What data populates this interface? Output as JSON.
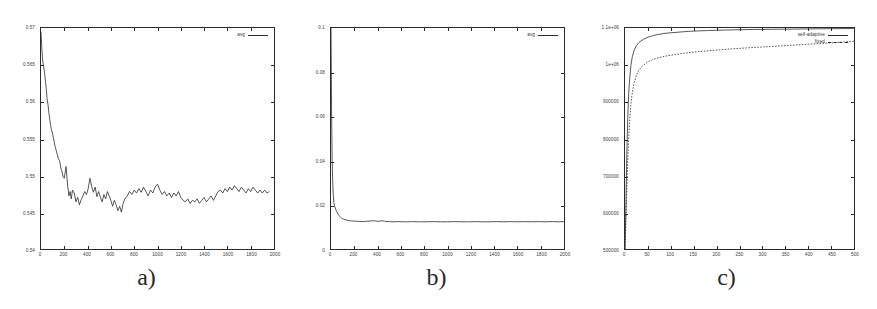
{
  "figure": {
    "background": "#ffffff",
    "line_color": "#2b2b2b",
    "panel_count": 3
  },
  "panels": [
    {
      "id": "a",
      "caption": "a)",
      "legend": [
        {
          "label": "avg",
          "style": "solid"
        }
      ],
      "chart_data": {
        "type": "line",
        "title": "",
        "xlabel": "",
        "ylabel": "",
        "xlim": [
          0,
          2000
        ],
        "ylim": [
          0.54,
          0.57
        ],
        "grid": false,
        "legend_position": "top-right",
        "xticks": [
          0,
          200,
          400,
          600,
          800,
          1000,
          1200,
          1400,
          1600,
          1800,
          2000
        ],
        "xtick_labels": [
          "0",
          "200",
          "400",
          "600",
          "800",
          "1000",
          "1200",
          "1400",
          "1600",
          "1800",
          "2000"
        ],
        "yticks": [
          0.54,
          0.545,
          0.55,
          0.555,
          0.56,
          0.565,
          0.57
        ],
        "ytick_labels": [
          "0.54",
          "0.545",
          "0.55",
          "0.555",
          "0.56",
          "0.565",
          "0.57"
        ],
        "series": [
          {
            "name": "avg",
            "x": [
              0,
              8,
              15,
              22,
              30,
              38,
              45,
              52,
              60,
              70,
              80,
              90,
              100,
              110,
              120,
              130,
              140,
              150,
              160,
              170,
              180,
              190,
              200,
              215,
              230,
              240,
              250,
              260,
              270,
              285,
              300,
              315,
              330,
              345,
              360,
              375,
              390,
              405,
              420,
              435,
              450,
              465,
              480,
              495,
              510,
              525,
              540,
              555,
              570,
              585,
              600,
              615,
              630,
              645,
              660,
              675,
              690,
              705,
              720,
              740,
              760,
              780,
              800,
              820,
              840,
              860,
              880,
              900,
              920,
              940,
              960,
              980,
              1000,
              1020,
              1040,
              1060,
              1080,
              1100,
              1120,
              1140,
              1160,
              1180,
              1200,
              1220,
              1240,
              1260,
              1280,
              1300,
              1320,
              1340,
              1360,
              1380,
              1400,
              1420,
              1440,
              1460,
              1480,
              1500,
              1520,
              1540,
              1560,
              1580,
              1600,
              1620,
              1640,
              1660,
              1680,
              1700,
              1720,
              1740,
              1760,
              1780,
              1800,
              1820,
              1840,
              1860,
              1880,
              1900,
              1920,
              1940,
              1960,
              1980,
              2000
            ],
            "y": [
              0.5695,
              0.567,
              0.5655,
              0.5648,
              0.564,
              0.5628,
              0.5618,
              0.5604,
              0.5596,
              0.5582,
              0.557,
              0.5562,
              0.5556,
              0.5548,
              0.554,
              0.5534,
              0.5528,
              0.5522,
              0.552,
              0.551,
              0.5505,
              0.5498,
              0.5496,
              0.5512,
              0.5484,
              0.5472,
              0.5478,
              0.5468,
              0.548,
              0.5476,
              0.5464,
              0.547,
              0.546,
              0.5467,
              0.5472,
              0.5478,
              0.5474,
              0.5482,
              0.5496,
              0.5485,
              0.5477,
              0.5484,
              0.5471,
              0.5478,
              0.547,
              0.5464,
              0.5474,
              0.5468,
              0.5478,
              0.5472,
              0.5466,
              0.5458,
              0.5466,
              0.546,
              0.5452,
              0.5458,
              0.545,
              0.5462,
              0.5468,
              0.5472,
              0.5478,
              0.5474,
              0.548,
              0.5476,
              0.5482,
              0.5477,
              0.5484,
              0.5478,
              0.5472,
              0.548,
              0.5476,
              0.5484,
              0.5488,
              0.548,
              0.5474,
              0.5478,
              0.5472,
              0.5476,
              0.547,
              0.5476,
              0.5472,
              0.5478,
              0.547,
              0.5466,
              0.5464,
              0.5468,
              0.5462,
              0.5466,
              0.5464,
              0.5468,
              0.5462,
              0.5466,
              0.547,
              0.5464,
              0.5468,
              0.5472,
              0.5466,
              0.5472,
              0.5478,
              0.548,
              0.5476,
              0.5482,
              0.5478,
              0.5484,
              0.548,
              0.5486,
              0.5482,
              0.5478,
              0.5484,
              0.548,
              0.5476,
              0.5482,
              0.5478,
              0.5484,
              0.548,
              0.5476,
              0.548,
              0.5476,
              0.548,
              0.5476,
              0.5478
            ]
          }
        ]
      }
    },
    {
      "id": "b",
      "caption": "b)",
      "legend": [
        {
          "label": "avg",
          "style": "solid"
        }
      ],
      "chart_data": {
        "type": "line",
        "title": "",
        "xlabel": "",
        "ylabel": "",
        "xlim": [
          0,
          2000
        ],
        "ylim": [
          0,
          0.1
        ],
        "grid": false,
        "legend_position": "top-right",
        "xticks": [
          0,
          200,
          400,
          600,
          800,
          1000,
          1200,
          1400,
          1600,
          1800,
          2000
        ],
        "xtick_labels": [
          "0",
          "200",
          "400",
          "600",
          "800",
          "1000",
          "1200",
          "1400",
          "1600",
          "1800",
          "2000"
        ],
        "yticks": [
          0,
          0.02,
          0.04,
          0.06,
          0.08,
          0.1
        ],
        "ytick_labels": [
          "0",
          "0.02",
          "0.04",
          "0.06",
          "0.08",
          "0.1"
        ],
        "series": [
          {
            "name": "avg",
            "x": [
              0,
              5,
              10,
              15,
              20,
              25,
              30,
              40,
              50,
              60,
              70,
              80,
              90,
              100,
              120,
              140,
              160,
              180,
              200,
              240,
              280,
              320,
              360,
              380,
              400,
              420,
              440,
              460,
              480,
              500,
              540,
              580,
              620,
              660,
              700,
              760,
              820,
              880,
              940,
              1000,
              1060,
              1120,
              1180,
              1240,
              1300,
              1360,
              1420,
              1480,
              1540,
              1600,
              1660,
              1720,
              1780,
              1840,
              1900,
              1960,
              2000
            ],
            "y": [
              0.1,
              0.062,
              0.04,
              0.03,
              0.024,
              0.021,
              0.0195,
              0.018,
              0.0168,
              0.0158,
              0.015,
              0.0145,
              0.014,
              0.0137,
              0.0133,
              0.013,
              0.0128,
              0.0127,
              0.0126,
              0.0125,
              0.0124,
              0.0126,
              0.0128,
              0.0127,
              0.0125,
              0.0126,
              0.0128,
              0.0126,
              0.0124,
              0.0124,
              0.0123,
              0.0124,
              0.0123,
              0.0123,
              0.0124,
              0.0123,
              0.0123,
              0.0124,
              0.0123,
              0.0123,
              0.0124,
              0.0123,
              0.0123,
              0.0124,
              0.0123,
              0.0123,
              0.0124,
              0.0123,
              0.0124,
              0.0123,
              0.0124,
              0.0123,
              0.0124,
              0.0123,
              0.0124,
              0.0123,
              0.0124
            ]
          }
        ]
      }
    },
    {
      "id": "c",
      "caption": "c)",
      "legend": [
        {
          "label": "self-adaptive",
          "style": "solid"
        },
        {
          "label": "fixed",
          "style": "dashed"
        }
      ],
      "chart_data": {
        "type": "line",
        "title": "",
        "xlabel": "",
        "ylabel": "",
        "xlim": [
          0,
          500
        ],
        "ylim": [
          500000,
          1100000
        ],
        "grid": false,
        "legend_position": "top-right",
        "xticks": [
          0,
          50,
          100,
          150,
          200,
          250,
          300,
          350,
          400,
          450,
          500
        ],
        "xtick_labels": [
          "0",
          "50",
          "100",
          "150",
          "200",
          "250",
          "300",
          "350",
          "400",
          "450",
          "500"
        ],
        "yticks": [
          500000,
          600000,
          700000,
          800000,
          900000,
          1000000,
          1100000
        ],
        "ytick_labels": [
          "500000",
          "600000",
          "700000",
          "800000",
          "900000",
          "1e+06",
          "1.1e+06"
        ],
        "series": [
          {
            "name": "self-adaptive",
            "x": [
              0,
              2,
              4,
              6,
              8,
              10,
              13,
              16,
              20,
              25,
              30,
              35,
              40,
              50,
              60,
              70,
              80,
              90,
              100,
              120,
              140,
              160,
              180,
              200,
              240,
              280,
              320,
              360,
              400,
              440,
              480,
              500
            ],
            "y": [
              500000,
              620000,
              760000,
              855000,
              920000,
              960000,
              1000000,
              1022000,
              1040000,
              1052000,
              1060000,
              1065000,
              1069000,
              1075000,
              1079000,
              1082000,
              1084000,
              1086000,
              1087000,
              1089000,
              1091000,
              1092000,
              1093000,
              1094000,
              1095000,
              1096000,
              1096500,
              1097000,
              1097500,
              1098000,
              1098500,
              1099000
            ]
          },
          {
            "name": "fixed",
            "x": [
              0,
              2,
              4,
              6,
              8,
              10,
              13,
              16,
              20,
              25,
              30,
              35,
              40,
              50,
              60,
              70,
              80,
              90,
              100,
              120,
              140,
              160,
              180,
              200,
              240,
              280,
              320,
              360,
              400,
              440,
              480,
              500
            ],
            "y": [
              500000,
              572000,
              665000,
              740000,
              800000,
              845000,
              895000,
              925000,
              952000,
              972000,
              985000,
              993000,
              999000,
              1008000,
              1014000,
              1018000,
              1021000,
              1024000,
              1026000,
              1030000,
              1033000,
              1036000,
              1038000,
              1040000,
              1044000,
              1047000,
              1050000,
              1053000,
              1056000,
              1059000,
              1062000,
              1064000
            ]
          }
        ]
      }
    }
  ]
}
